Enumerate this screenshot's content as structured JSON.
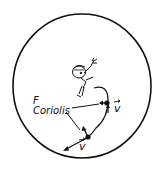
{
  "diagram": {
    "force_label": {
      "prefix": "F",
      "subscript": "Coriolis"
    },
    "velocity_labels": [
      {
        "symbol": "v",
        "vector": true,
        "position": "upper-right point"
      },
      {
        "symbol": "v",
        "vector": true,
        "position": "lower point"
      }
    ],
    "elements": {
      "disk": "large circle outline",
      "figure": "cartoon character (thrower) near center-top",
      "trajectory": "curved path from figure bending rightward then down-left",
      "points": 2
    },
    "colors": {
      "ink": "#111111",
      "background": "#ffffff"
    }
  }
}
